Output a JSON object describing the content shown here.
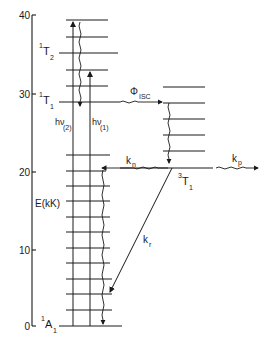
{
  "diagram": {
    "type": "jablonski-energy-level-diagram",
    "axis": {
      "label": "E(kK)",
      "ticks": [
        "0",
        "10",
        "20",
        "30",
        "40"
      ]
    },
    "states": {
      "ground": {
        "main": "A",
        "sup": "1",
        "sub": "1"
      },
      "singlet_T2": {
        "main": "T",
        "sup": "1",
        "sub": "2"
      },
      "singlet_T1": {
        "main": "T",
        "sup": "1",
        "sub": "1"
      },
      "triplet_T1": {
        "main": "T",
        "sup": "3",
        "sub": "1"
      }
    },
    "transitions": {
      "absorption_2": {
        "main": "hν",
        "sub": "(2)"
      },
      "absorption_1": {
        "main": "hν",
        "sub": "(1)"
      },
      "isc": {
        "main": "Φ",
        "sub": "ISC"
      },
      "nonradiative": {
        "main": "k",
        "sub": "n"
      },
      "phosphorescence_radiative": {
        "main": "k",
        "sub": "r"
      },
      "phosphorescence": {
        "main": "k",
        "sub": "p"
      }
    }
  }
}
